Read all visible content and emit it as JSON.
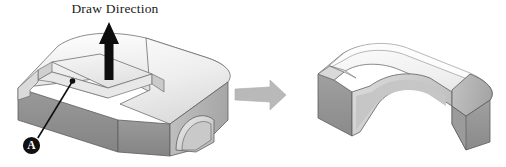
{
  "figure": {
    "title_label": "Draw Direction",
    "callout_label": "A",
    "background_color": "#ffffff",
    "width": 506,
    "height": 167
  },
  "annotations": {
    "draw_direction_text": "Draw Direction",
    "callout_marker_text": "A",
    "draw_arrow_icon": "up-arrow-icon",
    "process_arrow_icon": "right-arrow-icon",
    "leader_line_icon": "leader-line-icon"
  },
  "colors": {
    "face_front": "#8e8e8e",
    "face_front_dark": "#7f7f7f",
    "face_top": "#f2f2f2",
    "face_top_shade": "#e3e3e3",
    "face_side": "#b8b8b8",
    "face_inner": "#cccccc",
    "face_inner_dark": "#a8a8a8",
    "outline": "#555555",
    "arrow_black": "#0d0d0d",
    "arrow_gray": "#b9b9b9",
    "callout_fill": "#101010",
    "text": "#1a1a1a"
  },
  "parts": {
    "left_part_name": "cored-block-with-slot-and-arch",
    "right_part_name": "drawn-arch-shell-part"
  }
}
